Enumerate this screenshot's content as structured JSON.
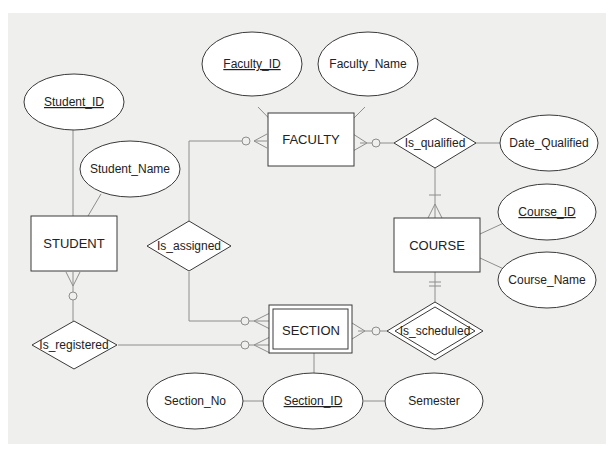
{
  "diagram": {
    "type": "ER diagram",
    "entities": [
      {
        "id": "faculty",
        "label": "FACULTY",
        "weak": false
      },
      {
        "id": "student",
        "label": "STUDENT",
        "weak": false
      },
      {
        "id": "course",
        "label": "COURSE",
        "weak": false
      },
      {
        "id": "section",
        "label": "SECTION",
        "weak": true
      }
    ],
    "relationships": [
      {
        "id": "is_qualified",
        "label": "Is_qualified",
        "identifying": false
      },
      {
        "id": "is_assigned",
        "label": "Is_assigned",
        "identifying": false
      },
      {
        "id": "is_registered",
        "label": "Is_registered",
        "identifying": false
      },
      {
        "id": "is_scheduled",
        "label": "Is_scheduled",
        "identifying": true
      }
    ],
    "attributes": [
      {
        "id": "faculty_id",
        "label": "Faculty_ID",
        "key": true,
        "of": "FACULTY"
      },
      {
        "id": "faculty_name",
        "label": "Faculty_Name",
        "key": false,
        "of": "FACULTY"
      },
      {
        "id": "student_id",
        "label": "Student_ID",
        "key": true,
        "of": "STUDENT"
      },
      {
        "id": "student_name",
        "label": "Student_Name",
        "key": false,
        "of": "STUDENT"
      },
      {
        "id": "date_qualified",
        "label": "Date_Qualified",
        "key": false,
        "of": "Is_qualified"
      },
      {
        "id": "course_id",
        "label": "Course_ID",
        "key": true,
        "of": "COURSE"
      },
      {
        "id": "course_name",
        "label": "Course_Name",
        "key": false,
        "of": "COURSE"
      },
      {
        "id": "section_no",
        "label": "Section_No",
        "key": false,
        "of": "Section_ID"
      },
      {
        "id": "section_id",
        "label": "Section_ID",
        "key": true,
        "of": "SECTION"
      },
      {
        "id": "semester",
        "label": "Semester",
        "key": false,
        "of": "Section_ID"
      }
    ],
    "connections": [
      {
        "from": "FACULTY",
        "to": "Is_assigned",
        "cardinality_at_faculty": "optional many"
      },
      {
        "from": "FACULTY",
        "to": "Is_qualified",
        "cardinality_at_faculty": "optional many"
      },
      {
        "from": "COURSE",
        "to": "Is_qualified",
        "cardinality_at_course": "mandatory many"
      },
      {
        "from": "COURSE",
        "to": "Is_scheduled",
        "cardinality_at_course": "mandatory one"
      },
      {
        "from": "SECTION",
        "to": "Is_scheduled",
        "cardinality_at_section": "optional many"
      },
      {
        "from": "SECTION",
        "to": "Is_assigned",
        "cardinality_at_section": "optional many"
      },
      {
        "from": "SECTION",
        "to": "Is_registered",
        "cardinality_at_section": "optional many"
      },
      {
        "from": "STUDENT",
        "to": "Is_registered",
        "cardinality_at_student": "optional many"
      }
    ],
    "colors": {
      "background": "#efefed",
      "shape_fill": "#ffffff",
      "line": "#8e8e8e",
      "outline": "#3a3a3a"
    }
  }
}
